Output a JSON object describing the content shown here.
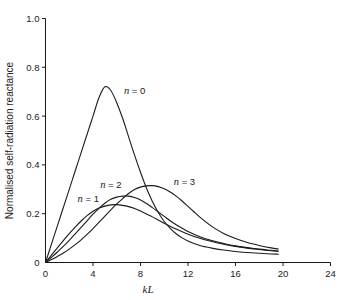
{
  "chart_data": {
    "type": "line",
    "title": "",
    "xlabel": "kL",
    "ylabel": "Normalised self-radiation reactance",
    "xlim": [
      0,
      24
    ],
    "ylim": [
      0,
      1.0
    ],
    "xticks": [
      0,
      4,
      8,
      12,
      16,
      20,
      24
    ],
    "xtick_labels": [
      "0",
      "4",
      "8",
      "12",
      "16",
      "20",
      "24"
    ],
    "yticks": [
      0,
      0.2,
      0.4,
      0.6,
      0.8,
      1.0
    ],
    "ytick_labels": [
      "0",
      "0.2",
      "0.4",
      "0.6",
      "0.8",
      "1.0"
    ],
    "grid": false,
    "legend_position": "inline-annotations",
    "series": [
      {
        "name": "n = 0",
        "label": "n = 0",
        "label_x": 6.6,
        "label_y": 0.705,
        "peak_x": 4.95,
        "peak_y": 0.72,
        "x": [
          0,
          0.5,
          1,
          1.5,
          2,
          2.5,
          3,
          3.5,
          4,
          4.5,
          5,
          5.5,
          6,
          6.5,
          7,
          7.5,
          8,
          8.5,
          9,
          9.5,
          10,
          10.5,
          11,
          11.5,
          12,
          12.5,
          13,
          13.5,
          14,
          15,
          16,
          17,
          18,
          19,
          19.6
        ],
        "y": [
          0.0,
          0.075,
          0.15,
          0.225,
          0.3,
          0.375,
          0.45,
          0.525,
          0.6,
          0.675,
          0.72,
          0.705,
          0.655,
          0.59,
          0.515,
          0.44,
          0.37,
          0.305,
          0.25,
          0.205,
          0.168,
          0.14,
          0.118,
          0.101,
          0.088,
          0.078,
          0.07,
          0.064,
          0.059,
          0.051,
          0.045,
          0.041,
          0.038,
          0.035,
          0.034
        ]
      },
      {
        "name": "n = 1",
        "label": "n = 1",
        "label_x": 2.7,
        "label_y": 0.262,
        "peak_x": 6.1,
        "peak_y": 0.237,
        "x": [
          0,
          0.5,
          1,
          1.5,
          2,
          2.5,
          3,
          3.5,
          4,
          4.5,
          5,
          5.5,
          6,
          6.5,
          7,
          7.5,
          8,
          8.5,
          9,
          9.5,
          10,
          11,
          12,
          13,
          14,
          15,
          16,
          17,
          18,
          19,
          19.6
        ],
        "y": [
          0.0,
          0.03,
          0.06,
          0.09,
          0.118,
          0.145,
          0.17,
          0.192,
          0.21,
          0.223,
          0.231,
          0.236,
          0.237,
          0.234,
          0.229,
          0.221,
          0.211,
          0.199,
          0.187,
          0.174,
          0.161,
          0.137,
          0.116,
          0.099,
          0.086,
          0.075,
          0.066,
          0.059,
          0.053,
          0.048,
          0.046
        ]
      },
      {
        "name": "n = 2",
        "label": "n = 2",
        "label_x": 4.6,
        "label_y": 0.32,
        "peak_x": 7.2,
        "peak_y": 0.272,
        "x": [
          0,
          0.5,
          1,
          1.5,
          2,
          2.5,
          3,
          3.5,
          4,
          4.5,
          5,
          5.5,
          6,
          6.5,
          7,
          7.5,
          8,
          8.5,
          9,
          9.5,
          10,
          10.5,
          11,
          12,
          13,
          14,
          15,
          16,
          17,
          18,
          19,
          19.6
        ],
        "y": [
          0.0,
          0.021,
          0.043,
          0.066,
          0.091,
          0.117,
          0.144,
          0.171,
          0.198,
          0.222,
          0.243,
          0.259,
          0.268,
          0.272,
          0.272,
          0.266,
          0.256,
          0.242,
          0.225,
          0.207,
          0.189,
          0.171,
          0.155,
          0.127,
          0.106,
          0.09,
          0.078,
          0.068,
          0.061,
          0.055,
          0.05,
          0.047
        ]
      },
      {
        "name": "n = 3",
        "label": "n = 3",
        "label_x": 10.8,
        "label_y": 0.33,
        "peak_x": 9.05,
        "peak_y": 0.315,
        "x": [
          0,
          0.5,
          1,
          1.5,
          2,
          2.5,
          3,
          3.5,
          4,
          4.5,
          5,
          5.5,
          6,
          6.5,
          7,
          7.5,
          8,
          8.5,
          9,
          9.5,
          10,
          10.5,
          11,
          11.5,
          12,
          12.5,
          13,
          14,
          15,
          16,
          17,
          18,
          19,
          19.6
        ],
        "y": [
          0.0,
          0.012,
          0.025,
          0.039,
          0.055,
          0.073,
          0.093,
          0.115,
          0.139,
          0.164,
          0.19,
          0.216,
          0.24,
          0.262,
          0.283,
          0.299,
          0.309,
          0.314,
          0.315,
          0.311,
          0.302,
          0.289,
          0.272,
          0.252,
          0.23,
          0.208,
          0.186,
          0.148,
          0.119,
          0.098,
          0.082,
          0.07,
          0.06,
          0.055
        ]
      }
    ]
  }
}
